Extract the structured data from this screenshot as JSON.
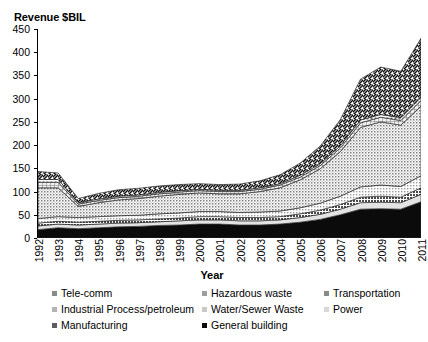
{
  "chart_data": {
    "type": "area",
    "stacked": true,
    "title": "",
    "ylabel": "Revenue $BIL",
    "xlabel": "Year",
    "ylim": [
      0,
      450
    ],
    "ytick_step": 50,
    "yticks": [
      0,
      50,
      100,
      150,
      200,
      250,
      300,
      350,
      400,
      450
    ],
    "grid": false,
    "legend_position": "bottom",
    "categories": [
      "1992",
      "1993",
      "1994",
      "1995",
      "1996",
      "1997",
      "1998",
      "1999",
      "2000",
      "2001",
      "2002",
      "2003",
      "2004",
      "2005",
      "2006",
      "2007",
      "2008",
      "2009",
      "2010",
      "2011"
    ],
    "series": [
      {
        "name": "General building",
        "pattern": "solid-black",
        "color": "#0b0b0b",
        "values": [
          18,
          22,
          20,
          22,
          24,
          25,
          27,
          28,
          30,
          30,
          28,
          28,
          30,
          34,
          40,
          50,
          62,
          63,
          62,
          78
        ]
      },
      {
        "name": "Power",
        "pattern": "light-gray",
        "color": "#d8d8d8",
        "values": [
          8,
          8,
          8,
          8,
          8,
          8,
          8,
          9,
          9,
          9,
          9,
          9,
          9,
          10,
          11,
          12,
          14,
          14,
          14,
          16
        ]
      },
      {
        "name": "Manufacturing",
        "pattern": "dark-dotted",
        "color": "#5d5d5d",
        "values": [
          6,
          6,
          6,
          6,
          6,
          6,
          6,
          6,
          7,
          7,
          7,
          7,
          7,
          8,
          9,
          10,
          12,
          13,
          12,
          14
        ]
      },
      {
        "name": "Water/Sewer Waste",
        "pattern": "fine-stipple",
        "color": "#c9c9c9",
        "values": [
          10,
          10,
          10,
          10,
          10,
          10,
          11,
          11,
          11,
          11,
          11,
          12,
          12,
          13,
          15,
          18,
          22,
          24,
          23,
          26
        ]
      },
      {
        "name": "Industrial Process/petroleum",
        "pattern": "cross-stipple",
        "color": "#b4b4b4",
        "values": [
          66,
          62,
          24,
          30,
          34,
          36,
          38,
          40,
          40,
          38,
          40,
          44,
          50,
          60,
          74,
          96,
          128,
          136,
          132,
          150
        ]
      },
      {
        "name": "Hazardous waste",
        "pattern": "grid-gray",
        "color": "#9e9e9e",
        "values": [
          12,
          12,
          5,
          5,
          5,
          5,
          5,
          5,
          5,
          5,
          5,
          5,
          6,
          6,
          7,
          8,
          10,
          10,
          10,
          12
        ]
      },
      {
        "name": "Tele-comm",
        "pattern": "small-square",
        "color": "#8a8a8a",
        "values": [
          6,
          6,
          3,
          3,
          3,
          3,
          3,
          3,
          3,
          3,
          3,
          3,
          3,
          4,
          4,
          5,
          6,
          6,
          6,
          7
        ]
      },
      {
        "name": "Transportation",
        "pattern": "diagonal-hatch",
        "color": "#8a8a8a",
        "values": [
          17,
          14,
          9,
          12,
          14,
          14,
          14,
          13,
          12,
          12,
          13,
          15,
          19,
          26,
          38,
          56,
          88,
          102,
          100,
          127
        ]
      }
    ],
    "totals": [
      143,
      130,
      85,
      96,
      104,
      107,
      112,
      115,
      117,
      115,
      116,
      123,
      136,
      161,
      198,
      255,
      342,
      368,
      359,
      430
    ]
  },
  "legend": {
    "items": [
      {
        "label": "Tele-comm",
        "swatch": "sw-hatch",
        "col": 0,
        "row": 0
      },
      {
        "label": "Industrial Process/petroleum",
        "swatch": "sw-crosshatch",
        "col": 0,
        "row": 1
      },
      {
        "label": "Manufacturing",
        "swatch": "sw-darkdot",
        "col": 0,
        "row": 2
      },
      {
        "label": "Hazardous waste",
        "swatch": "sw-gridgray",
        "col": 1,
        "row": 0
      },
      {
        "label": "Water/Sewer Waste",
        "swatch": "sw-stipple",
        "col": 1,
        "row": 1
      },
      {
        "label": "General building",
        "swatch": "sw-black",
        "col": 1,
        "row": 2
      },
      {
        "label": "Transportation",
        "swatch": "sw-hatch",
        "col": 2,
        "row": 0
      },
      {
        "label": "Power",
        "swatch": "sw-lightgray",
        "col": 2,
        "row": 1
      }
    ]
  }
}
